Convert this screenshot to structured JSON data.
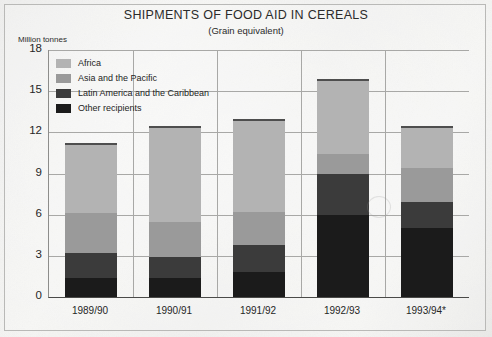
{
  "chart_data": {
    "type": "bar",
    "subtype": "stacked",
    "title": "SHIPMENTS OF FOOD AID IN CEREALS",
    "subtitle": "(Grain equivalent)",
    "xlabel": "",
    "ylabel": "Million tonnes",
    "ylim": [
      0,
      18
    ],
    "yticks": [
      0,
      3,
      6,
      9,
      12,
      15,
      18
    ],
    "grid": true,
    "legend_position": "top-left inside plot",
    "categories": [
      "1989/90",
      "1990/91",
      "1991/92",
      "1992/93",
      "1993/94*"
    ],
    "series": [
      {
        "name": "Other recipients",
        "color": "#1b1b1b",
        "values": [
          1.4,
          1.4,
          1.8,
          6.0,
          5.0
        ]
      },
      {
        "name": "Latin America and the Caribbean",
        "color": "#3b3b3b",
        "values": [
          1.8,
          1.5,
          2.0,
          3.0,
          1.9
        ]
      },
      {
        "name": "Asia and the Pacific",
        "color": "#9a9a9a",
        "values": [
          2.9,
          2.6,
          2.4,
          1.4,
          2.5
        ]
      },
      {
        "name": "Africa",
        "color": "#b3b3b3",
        "values": [
          5.1,
          7.0,
          6.8,
          5.5,
          3.1
        ]
      }
    ],
    "totals": [
      11.2,
      12.5,
      13.0,
      15.9,
      12.5
    ],
    "stack_order_bottom_to_top": [
      "Other recipients",
      "Latin America and the Caribbean",
      "Asia and the Pacific",
      "Africa"
    ]
  },
  "legend": {
    "items": [
      {
        "label": "Africa",
        "color": "#b3b3b3"
      },
      {
        "label": "Asia and the Pacific",
        "color": "#9a9a9a"
      },
      {
        "label": "Latin America and the Caribbean",
        "color": "#3b3b3b"
      },
      {
        "label": "Other recipients",
        "color": "#1b1b1b"
      }
    ]
  },
  "colors": {
    "page_background": "#f2f2f0",
    "frame_border": "#b9b9b7",
    "gridline": "#a8a8a6",
    "axis": "#4a4a48",
    "text": "#262626"
  }
}
